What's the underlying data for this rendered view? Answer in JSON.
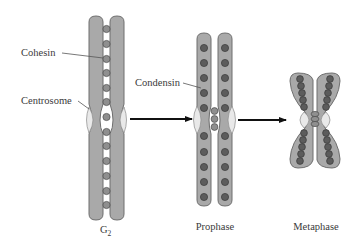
{
  "figure": {
    "colors": {
      "chromatid_fill": "#a9a9a9",
      "chromatid_stroke": "#6e6e6e",
      "cohesin_bead": "#8f8f8f",
      "condensin_bead": "#5c5c5c",
      "bead_stroke": "#4a4a4a",
      "centrosome_fill": "#e9e9e9",
      "arrow": "#111111",
      "text": "#3a3a3a"
    }
  },
  "labels": {
    "cohesin": "Cohesin",
    "centrosome": "Centrosome",
    "condensin": "Condensin"
  },
  "stages": [
    {
      "name": "G2",
      "label_main": "G",
      "label_sub": "2"
    },
    {
      "name": "Prophase",
      "label_main": "Prophase"
    },
    {
      "name": "Metaphase",
      "label_main": "Metaphase"
    }
  ],
  "arrows": [
    {
      "from": "G2",
      "to": "Prophase"
    },
    {
      "from": "Prophase",
      "to": "Metaphase"
    }
  ]
}
